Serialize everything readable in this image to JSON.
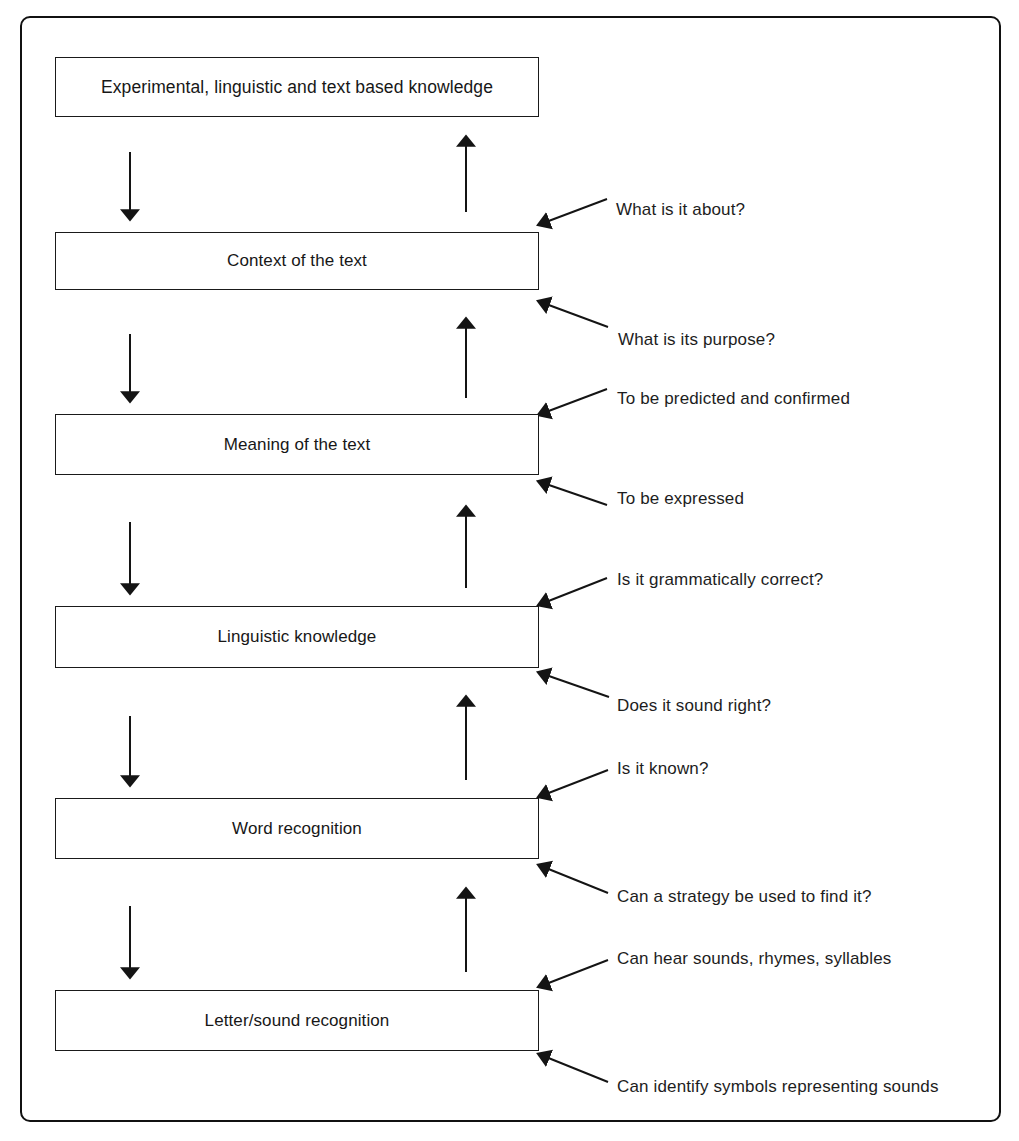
{
  "diagram": {
    "frame": {
      "style": "rounded-rectangle",
      "color": "#111111"
    },
    "stages": [
      {
        "id": "experimental-knowledge",
        "label": "Experimental, linguistic and text based knowledge",
        "x": 55,
        "y": 57,
        "w": 484,
        "h": 60,
        "align": "wide"
      },
      {
        "id": "context-of-text",
        "label": "Context of the text",
        "x": 55,
        "y": 232,
        "w": 484,
        "h": 58,
        "align": "center"
      },
      {
        "id": "meaning-of-text",
        "label": "Meaning of the text",
        "x": 55,
        "y": 414,
        "w": 484,
        "h": 61,
        "align": "center"
      },
      {
        "id": "linguistic-knowledge",
        "label": "Linguistic knowledge",
        "x": 55,
        "y": 606,
        "w": 484,
        "h": 62,
        "align": "center"
      },
      {
        "id": "word-recognition",
        "label": "Word recognition",
        "x": 55,
        "y": 798,
        "w": 484,
        "h": 61,
        "align": "center"
      },
      {
        "id": "letter-sound-recognition",
        "label": "Letter/sound recognition",
        "x": 55,
        "y": 990,
        "w": 484,
        "h": 61,
        "align": "center"
      }
    ],
    "down_arrows": [
      {
        "id": "down-1",
        "x": 130,
        "y1": 152,
        "y2": 214
      },
      {
        "id": "down-2",
        "x": 130,
        "y1": 334,
        "y2": 396
      },
      {
        "id": "down-3",
        "x": 130,
        "y1": 522,
        "y2": 588
      },
      {
        "id": "down-4",
        "x": 130,
        "y1": 716,
        "y2": 780
      },
      {
        "id": "down-5",
        "x": 130,
        "y1": 906,
        "y2": 972
      }
    ],
    "up_arrows": [
      {
        "id": "up-1",
        "x": 466,
        "y1": 212,
        "y2": 142
      },
      {
        "id": "up-2",
        "x": 466,
        "y1": 398,
        "y2": 324
      },
      {
        "id": "up-3",
        "x": 466,
        "y1": 588,
        "y2": 512
      },
      {
        "id": "up-4",
        "x": 466,
        "y1": 780,
        "y2": 702
      },
      {
        "id": "up-5",
        "x": 466,
        "y1": 972,
        "y2": 894
      }
    ],
    "annotations": [
      {
        "id": "what-is-it-about",
        "text": "What is it about?",
        "label_x": 616,
        "label_y": 201,
        "tip_x": 546,
        "tip_y": 222,
        "tail_x": 607,
        "tail_y": 199
      },
      {
        "id": "what-is-its-purpose",
        "text": "What is its purpose?",
        "label_x": 618,
        "label_y": 331,
        "tip_x": 546,
        "tip_y": 304,
        "tail_x": 608,
        "tail_y": 327
      },
      {
        "id": "to-be-predicted-and-confirmed",
        "text": "To be predicted and confirmed",
        "label_x": 617,
        "label_y": 390,
        "tip_x": 546,
        "tip_y": 412,
        "tail_x": 607,
        "tail_y": 389
      },
      {
        "id": "to-be-expressed",
        "text": "To be expressed",
        "label_x": 617,
        "label_y": 490,
        "tip_x": 546,
        "tip_y": 484,
        "tail_x": 607,
        "tail_y": 505
      },
      {
        "id": "is-it-grammatically-correct",
        "text": "Is it grammatically correct?",
        "label_x": 617,
        "label_y": 571,
        "tip_x": 546,
        "tip_y": 602,
        "tail_x": 607,
        "tail_y": 578
      },
      {
        "id": "does-it-sound-right",
        "text": "Does it sound right?",
        "label_x": 617,
        "label_y": 697,
        "tip_x": 546,
        "tip_y": 675,
        "tail_x": 609,
        "tail_y": 697
      },
      {
        "id": "is-it-known",
        "text": "Is it known?",
        "label_x": 617,
        "label_y": 760,
        "tip_x": 546,
        "tip_y": 794,
        "tail_x": 608,
        "tail_y": 770
      },
      {
        "id": "can-a-strategy-be-used",
        "text": "Can a strategy be used to find it?",
        "label_x": 617,
        "label_y": 888,
        "tip_x": 546,
        "tip_y": 868,
        "tail_x": 608,
        "tail_y": 893
      },
      {
        "id": "can-hear-sounds",
        "text": "Can hear sounds, rhymes, syllables",
        "label_x": 617,
        "label_y": 950,
        "tip_x": 546,
        "tip_y": 984,
        "tail_x": 608,
        "tail_y": 960
      },
      {
        "id": "can-identify-symbols",
        "text": "Can identify symbols representing sounds",
        "label_x": 617,
        "label_y": 1078,
        "tip_x": 546,
        "tip_y": 1057,
        "tail_x": 608,
        "tail_y": 1082
      }
    ]
  }
}
